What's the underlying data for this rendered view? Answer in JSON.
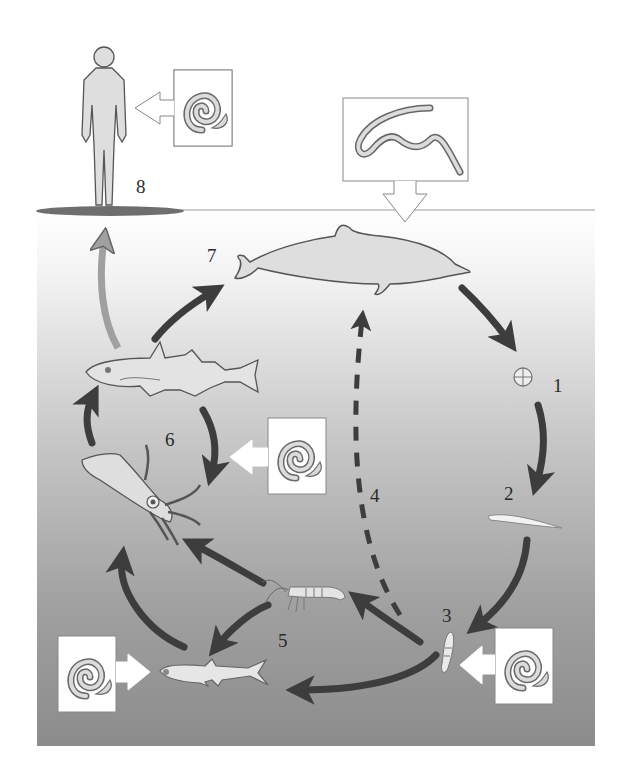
{
  "diagram": {
    "colors": {
      "sea_top": "#ffffff",
      "sea_mid": "#c9c9c9",
      "sea_bottom": "#8f8f8f",
      "arrow_dark": "#3d3d3d",
      "arrow_human": "#9a9a9a",
      "organism_fill": "#dedede",
      "outline": "#555555",
      "ground": "#6e6e6e"
    },
    "stages": [
      {
        "number": "1",
        "label": "Egg",
        "icon": "egg-icon"
      },
      {
        "number": "2",
        "label": "Free-living larva",
        "icon": "larva-icon"
      },
      {
        "number": "3",
        "label": "Crustacean first intermediate host",
        "icon": "copepod-icon"
      },
      {
        "number": "4",
        "label": "Direct transmission to definitive host",
        "icon": "dashed-arrow"
      },
      {
        "number": "5",
        "label": "Krill and small fish",
        "icon": "krill-icon"
      },
      {
        "number": "6",
        "label": "Squid and fish paratenic hosts",
        "icon": "squid-icon"
      },
      {
        "number": "7",
        "label": "Marine mammal definitive host",
        "icon": "dolphin-icon"
      },
      {
        "number": "8",
        "label": "Human accidental host",
        "icon": "human-icon"
      }
    ],
    "insets": [
      {
        "id": "adult-worm",
        "icon": "adult-worm-icon"
      },
      {
        "id": "coiled-larva-human",
        "icon": "coiled-larva-icon"
      },
      {
        "id": "coiled-larva-squid",
        "icon": "coiled-larva-icon"
      },
      {
        "id": "coiled-larva-copepod",
        "icon": "coiled-larva-icon"
      },
      {
        "id": "coiled-larva-smallfish",
        "icon": "coiled-larva-icon"
      }
    ]
  }
}
